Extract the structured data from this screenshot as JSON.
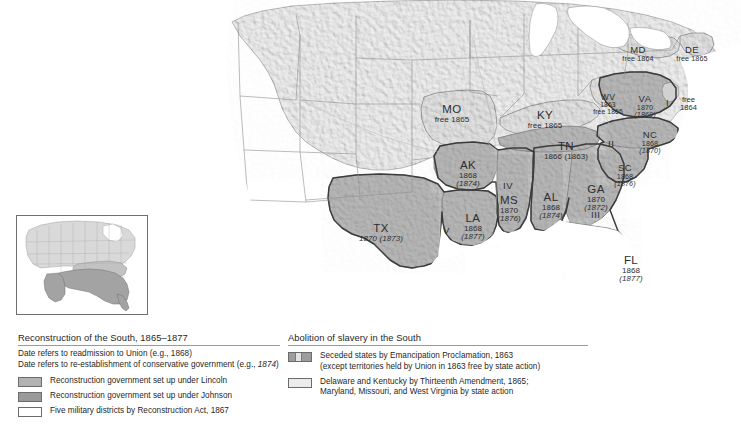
{
  "map": {
    "title_hidden": "",
    "states": [
      {
        "id": "MO",
        "abbr": "MO",
        "line1": "free 1865",
        "line2": "",
        "x": 452,
        "y": 104,
        "size": "normal"
      },
      {
        "id": "KY",
        "abbr": "KY",
        "line1": "free 1865",
        "line2": "",
        "x": 545,
        "y": 110,
        "size": "normal"
      },
      {
        "id": "TN",
        "abbr": "TN",
        "line1": "1866 (1863)",
        "line2": "",
        "x": 566,
        "y": 141,
        "size": "normal"
      },
      {
        "id": "AK",
        "abbr": "AK",
        "line1": "1868",
        "line2": "(1874)",
        "x": 468,
        "y": 160,
        "size": "normal"
      },
      {
        "id": "LA",
        "abbr": "LA",
        "line1": "1868",
        "line2": "(1877)",
        "x": 473,
        "y": 213,
        "size": "normal"
      },
      {
        "id": "MS",
        "abbr": "MS",
        "line1": "1870",
        "line2": "(1876)",
        "x": 509,
        "y": 195,
        "size": "normal"
      },
      {
        "id": "AL",
        "abbr": "AL",
        "line1": "1868",
        "line2": "(1874)",
        "x": 551,
        "y": 192,
        "size": "normal"
      },
      {
        "id": "GA",
        "abbr": "GA",
        "line1": "1870",
        "line2": "(1872)",
        "x": 596,
        "y": 184,
        "size": "normal"
      },
      {
        "id": "TX",
        "abbr": "TX",
        "line1": "1870 (1873)",
        "line2": "",
        "x": 381,
        "y": 223,
        "size": "normal"
      },
      {
        "id": "FL",
        "abbr": "FL",
        "line1": "1868",
        "line2": "(1877)",
        "x": 631,
        "y": 255,
        "size": "normal"
      },
      {
        "id": "SC",
        "abbr": "SC",
        "line1": "1868",
        "line2": "(1876)",
        "x": 625,
        "y": 163,
        "size": "small"
      },
      {
        "id": "NC",
        "abbr": "NC",
        "line1": "1868",
        "line2": "(1870)",
        "x": 650,
        "y": 130,
        "size": "small"
      },
      {
        "id": "VA",
        "abbr": "VA",
        "line1": "1870",
        "line2": "(1869)",
        "x": 645,
        "y": 94,
        "size": "small"
      },
      {
        "id": "WV",
        "abbr": "WV",
        "line1": "1863",
        "line2": "free 1865",
        "x": 608,
        "y": 93,
        "size": "tiny"
      },
      {
        "id": "MD",
        "abbr": "MD",
        "line1": "free 1864",
        "line2": "",
        "x": 638,
        "y": 45,
        "size": "small"
      },
      {
        "id": "DE",
        "abbr": "DE",
        "line1": "free 1865",
        "line2": "",
        "x": 692,
        "y": 45,
        "size": "small"
      }
    ],
    "districts": [
      {
        "numeral": "I",
        "x": 666,
        "y": 97
      },
      {
        "numeral": "II",
        "x": 608,
        "y": 138
      },
      {
        "numeral": "III",
        "x": 591,
        "y": 209
      },
      {
        "numeral": "IV",
        "x": 509,
        "y": 180
      },
      {
        "numeral": "V",
        "x": 443,
        "y": 225
      }
    ],
    "annotations": [
      {
        "id": "nj-free",
        "line1": "free",
        "line2": "1864",
        "x": 680,
        "y": 99
      }
    ]
  },
  "legend_left": {
    "title": "Reconstruction of the South, 1865–1877",
    "note_line1": "Date refers to readmission to Union (e.g., 1868)",
    "note_line2_prefix": "Date refers to re-establishment of conservative government (e.g., ",
    "note_line2_italic": "1874",
    "note_line2_suffix": ")",
    "items": [
      {
        "swatch": "lincoln",
        "label": "Reconstruction government set up under Lincoln"
      },
      {
        "swatch": "johnson",
        "label": "Reconstruction government set up under Johnson"
      },
      {
        "swatch": "district",
        "label": "Five military districts by Reconstruction Act, 1867"
      }
    ]
  },
  "legend_right": {
    "title": "Abolition of slavery in the South",
    "items": [
      {
        "swatch": "seceded",
        "label_line1": "Seceded states by Emancipation Proclamation, 1863",
        "label_line2": "(except territories held by Union in 1863 free by state action)"
      },
      {
        "swatch": "thirteenth",
        "label_line1": "Delaware and Kentucky by Thirteenth Amendment, 1865;",
        "label_line2": "Maryland, Missouri, and West Virginia by state action"
      }
    ]
  },
  "colors": {
    "seceded_dark": "#9d9d9d",
    "johnson_gray": "#9a9a9a",
    "lincoln_gray": "#b2b2b2",
    "border_state": "#e0e0e0",
    "terrain_light": "#e7e7e7",
    "ocean": "#ffffff",
    "outline": "#6f6f6f"
  }
}
